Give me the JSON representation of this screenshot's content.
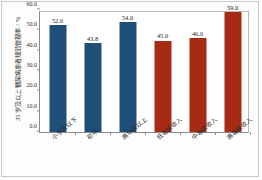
{
  "chart_data": {
    "type": "bar",
    "title": "",
    "xlabel": "",
    "ylabel": "35 岁及以上糖尿病患者规范管理率 / %",
    "ylim": [
      0.0,
      60.0
    ],
    "ytick_labels": [
      "0.0",
      "10.0",
      "20.0",
      "30.0",
      "40.0",
      "50.0",
      "60.0"
    ],
    "ytick_values": [
      0.0,
      10.0,
      20.0,
      30.0,
      40.0,
      50.0,
      60.0
    ],
    "grid": false,
    "legend": "none",
    "categories": [
      "小学及以下",
      "初中",
      "高中及以上",
      "低等级收入",
      "中等级收入",
      "高等级收入"
    ],
    "values": [
      52.6,
      43.8,
      54.0,
      45.0,
      46.0,
      59.0
    ],
    "value_labels": [
      "52.6",
      "43.8",
      "54.0",
      "45.0",
      "46.0",
      "59.0"
    ],
    "bar_colors": [
      "#1f4e79",
      "#1f4e79",
      "#1f4e79",
      "#a62a14",
      "#a62a14",
      "#a62a14"
    ],
    "colors": {
      "education_group": "#1f4e79",
      "income_group": "#a62a14",
      "axis": "#8a8a8a",
      "text": "#2b2b2b"
    }
  }
}
